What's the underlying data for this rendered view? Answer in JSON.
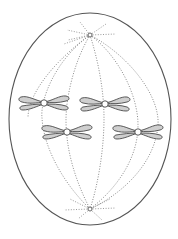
{
  "diagram": {
    "title": "Cell in metaphase of mitosis",
    "colors": {
      "background": "#ffffff",
      "membrane": "#555555",
      "spindle": "#8a8a8a",
      "chromatid_fill": "#cfcfcf",
      "chromatid_stroke": "#4a4a4a"
    },
    "cell": {
      "cx": 90,
      "cy": 119,
      "rx": 81,
      "ry": 106
    },
    "poles": [
      {
        "name": "top-centrosome",
        "x": 90,
        "y": 35
      },
      {
        "name": "bottom-centrosome",
        "x": 90,
        "y": 209
      }
    ],
    "chromosomes": [
      {
        "name": "chromosome-1",
        "x": 44,
        "y": 103
      },
      {
        "name": "chromosome-2",
        "x": 105,
        "y": 104
      },
      {
        "name": "chromosome-3",
        "x": 67,
        "y": 132
      },
      {
        "name": "chromosome-4",
        "x": 138,
        "y": 132
      }
    ],
    "labels": []
  }
}
